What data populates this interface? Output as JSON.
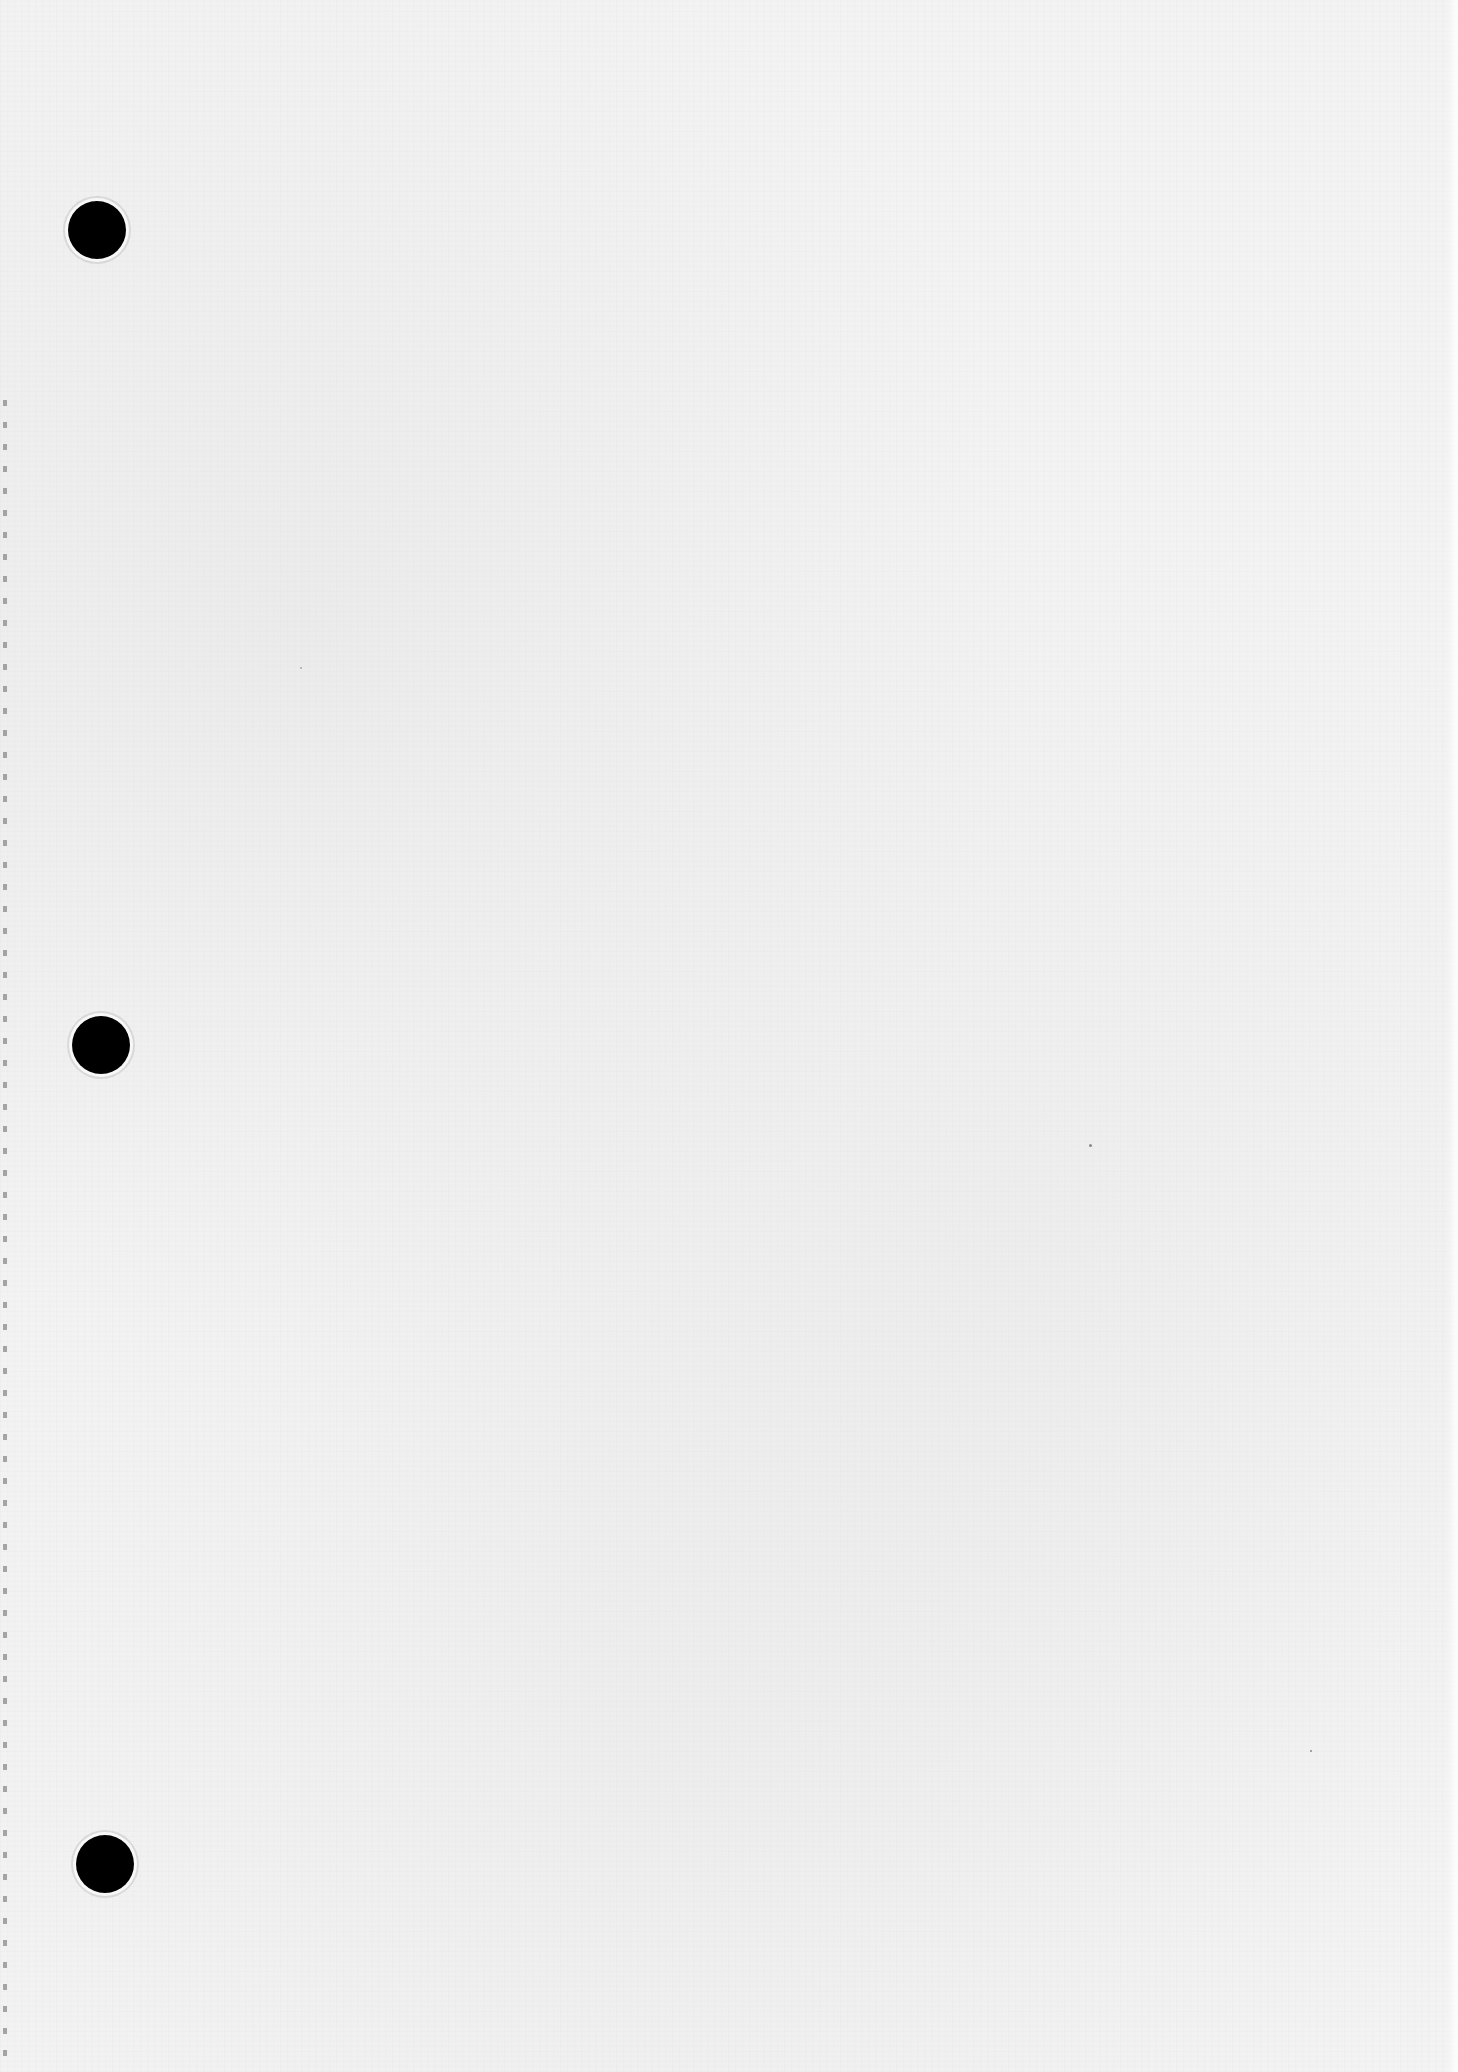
{
  "page": {
    "type": "blank-paper-sheet",
    "text_content": "",
    "paper_color": "#f3f3f3",
    "hole_color": "#000000"
  },
  "punch_holes": [
    {
      "position": "top"
    },
    {
      "position": "middle"
    },
    {
      "position": "bottom"
    }
  ],
  "left_edge": {
    "style": "perforated"
  }
}
